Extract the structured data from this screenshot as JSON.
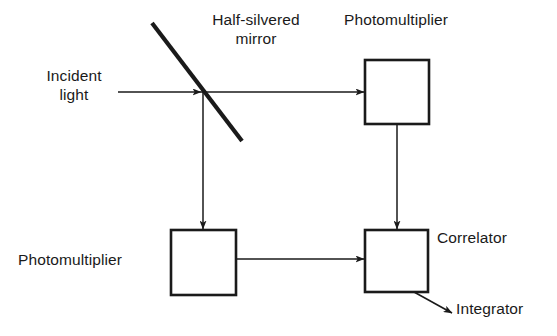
{
  "diagram": {
    "ink_color": "#1a1a1a",
    "background_color": "#ffffff",
    "labels": {
      "incident_light_line1": "Incident",
      "incident_light_line2": "light",
      "mirror_line1": "Half-silvered",
      "mirror_line2": "mirror",
      "photomultiplier_top": "Photomultiplier",
      "photomultiplier_bottom": "Photomultiplier",
      "correlator": "Correlator",
      "integrator": "Integrator"
    },
    "nodes": [
      {
        "name": "photomultiplier-top-box",
        "x": 365,
        "y": 60,
        "w": 64,
        "h": 64
      },
      {
        "name": "photomultiplier-bottom-box",
        "x": 171,
        "y": 230,
        "w": 65,
        "h": 65
      },
      {
        "name": "correlator-box",
        "x": 365,
        "y": 230,
        "w": 63,
        "h": 62
      }
    ],
    "mirror": {
      "x1": 152,
      "y1": 23,
      "x2": 242,
      "y2": 141,
      "stroke_width": 4
    },
    "beams": [
      {
        "name": "incident-beam",
        "x1": 118,
        "y1": 92,
        "x2": 203,
        "y2": 92,
        "arrow": true
      },
      {
        "name": "transmitted-beam",
        "x1": 203,
        "y1": 92,
        "x2": 365,
        "y2": 92,
        "arrow": true
      },
      {
        "name": "reflected-beam",
        "x1": 203,
        "y1": 92,
        "x2": 203,
        "y2": 230,
        "arrow": true
      },
      {
        "name": "pm-top-to-correlator",
        "x1": 397,
        "y1": 124,
        "x2": 397,
        "y2": 230,
        "arrow": true
      },
      {
        "name": "pm-bottom-to-correlator",
        "x1": 236,
        "y1": 259,
        "x2": 365,
        "y2": 259,
        "arrow": true
      },
      {
        "name": "correlator-to-integrator",
        "x1": 414,
        "y1": 292,
        "x2": 452,
        "y2": 313,
        "arrow": true
      }
    ]
  }
}
